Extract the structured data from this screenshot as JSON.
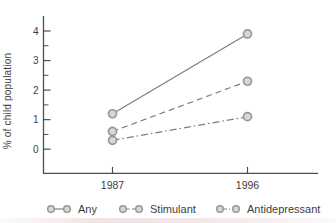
{
  "chart_data": {
    "type": "line",
    "x": [
      "1987",
      "1996"
    ],
    "series": [
      {
        "name": "Any",
        "values": [
          1.2,
          3.9
        ],
        "line_style": "solid"
      },
      {
        "name": "Stimulant",
        "values": [
          0.6,
          2.3
        ],
        "line_style": "dashed"
      },
      {
        "name": "Antidepressant",
        "values": [
          0.3,
          1.1
        ],
        "line_style": "dashdot"
      }
    ],
    "ylabel": "% of child population",
    "xlabel": "",
    "ylim": [
      0,
      4
    ],
    "ytick_step": 1,
    "yminor_step": 0.5,
    "ytick_labels": [
      "0",
      "1",
      "2",
      "3",
      "4"
    ],
    "xtick_labels": [
      "1987",
      "1996"
    ],
    "grid": false,
    "legend_position": "bottom"
  },
  "colors": {
    "background": "#ffffff",
    "axis": "#4e4e4e",
    "tick_text": "#3e3e3e",
    "series_line": "#7f7f7f",
    "marker_fill": "#d7d7d7",
    "marker_stroke": "#979797"
  }
}
